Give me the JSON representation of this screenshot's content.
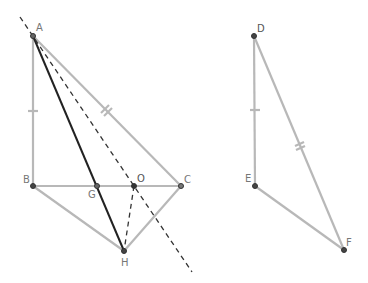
{
  "diagram": {
    "colors": {
      "gray_segment": "#b8b8b8",
      "dark_segment": "#222222",
      "dashed": "#333333",
      "point_fill": "#444444"
    },
    "points": {
      "A": {
        "label": "A",
        "x": 33,
        "y": 36
      },
      "B": {
        "label": "B",
        "x": 33,
        "y": 186
      },
      "G": {
        "label": "G",
        "x": 97,
        "y": 186
      },
      "O": {
        "label": "O",
        "x": 134,
        "y": 186
      },
      "C": {
        "label": "C",
        "x": 181,
        "y": 186
      },
      "H": {
        "label": "H",
        "x": 124,
        "y": 251
      },
      "D": {
        "label": "D",
        "x": 254,
        "y": 36
      },
      "E": {
        "label": "E",
        "x": 255,
        "y": 186
      },
      "F": {
        "label": "F",
        "x": 344,
        "y": 250
      }
    },
    "segments": [
      {
        "from": "A",
        "to": "B",
        "style": "gray",
        "tick": 1
      },
      {
        "from": "A",
        "to": "C",
        "style": "gray",
        "tick": 2
      },
      {
        "from": "B",
        "to": "C",
        "style": "gray"
      },
      {
        "from": "B",
        "to": "H",
        "style": "gray"
      },
      {
        "from": "H",
        "to": "C",
        "style": "gray"
      },
      {
        "from": "A",
        "to": "H",
        "style": "dark"
      },
      {
        "from": "O",
        "to": "H",
        "style": "dashed"
      },
      {
        "from": "D",
        "to": "E",
        "style": "gray",
        "tick": 1
      },
      {
        "from": "D",
        "to": "F",
        "style": "gray",
        "tick": 2
      },
      {
        "from": "E",
        "to": "F",
        "style": "gray"
      }
    ],
    "dashed_line": {
      "from": [
        20,
        17
      ],
      "to": [
        192,
        272
      ]
    }
  }
}
